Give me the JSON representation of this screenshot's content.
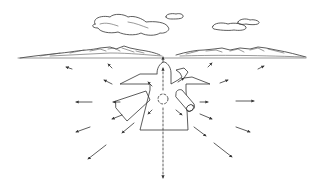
{
  "illustration": {
    "subject": "Shape laid out on ground with arrows radiating outward from a central marker, landscape horizon with mountain ranges and clouds",
    "colors": {
      "ink": "#333333",
      "background": "#ffffff"
    },
    "elements": {
      "clouds": 3,
      "mountain_ranges": 2,
      "ground_shape": "cross-shaped panel layout",
      "center_marker": "dotted circle",
      "rolled_panel": "cylindrical roll on right side",
      "radiating_arrows": 22
    }
  }
}
